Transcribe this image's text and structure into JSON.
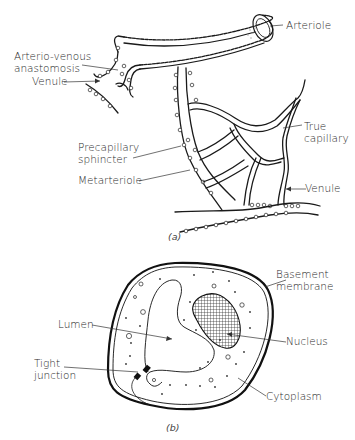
{
  "figure": {
    "panel_a": {
      "caption": "(a)",
      "labels": {
        "arteriole": "Arteriole",
        "av_anastomosis_line1": "Arterio-venous",
        "av_anastomosis_line2": "anastomosis",
        "venule_left": "Venule",
        "true_capillary_line1": "True",
        "true_capillary_line2": "capillary",
        "precapillary_line1": "Precapillary",
        "precapillary_line2": "sphincter",
        "metarteriole": "Metarteriole",
        "venule_right": "Venule"
      }
    },
    "panel_b": {
      "caption": "(b)",
      "labels": {
        "basement_line1": "Basement",
        "basement_line2": "membrane",
        "lumen": "Lumen",
        "nucleus": "Nucleus",
        "tight_line1": "Tight",
        "tight_line2": "junction",
        "cytoplasm": "Cytoplasm"
      }
    }
  }
}
